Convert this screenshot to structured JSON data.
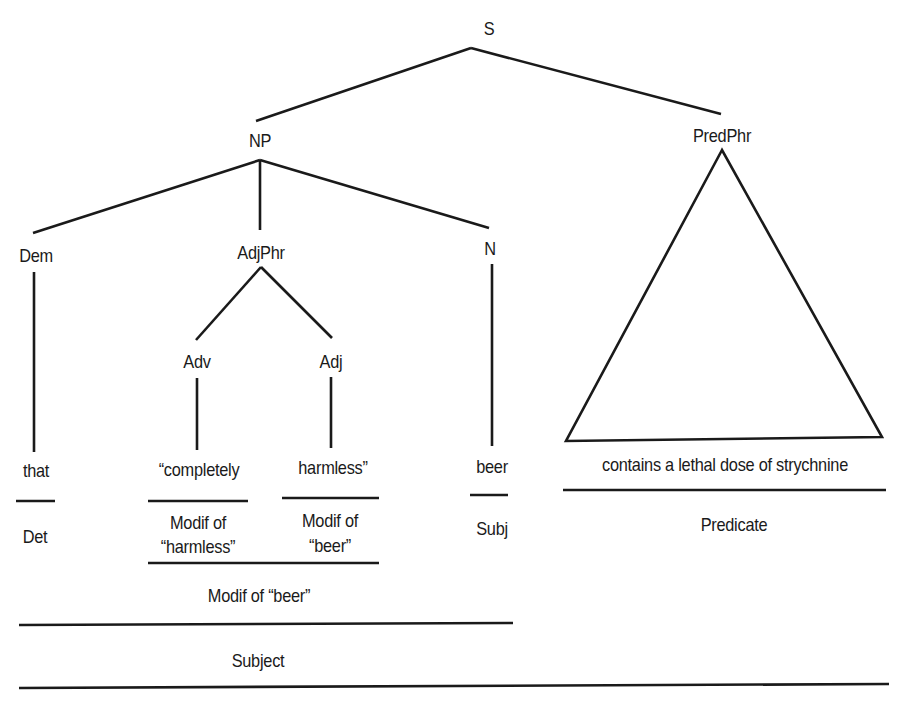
{
  "tree": {
    "root": "S",
    "np": "NP",
    "predphr": "PredPhr",
    "dem": "Dem",
    "adjphr": "AdjPhr",
    "n": "N",
    "adv": "Adv",
    "adj": "Adj"
  },
  "words": {
    "that": "that",
    "completely": "“completely",
    "harmless": "harmless”",
    "beer": "beer",
    "predicate_phrase": "contains a lethal dose of strychnine"
  },
  "functions": {
    "det": "Det",
    "modif_harmless_1": "Modif of",
    "modif_harmless_2": "“harmless”",
    "modif_beer_1": "Modif of",
    "modif_beer_2": "“beer”",
    "subj": "Subj",
    "modif_of_beer": "Modif of “beer”",
    "subject": "Subject",
    "predicate": "Predicate"
  },
  "colors": {
    "line": "#1a1a1a",
    "background": "#ffffff"
  }
}
